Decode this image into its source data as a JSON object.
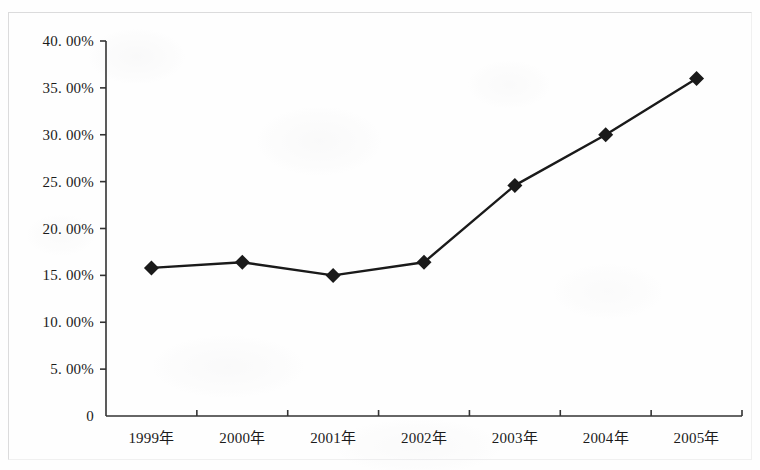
{
  "chart_data": {
    "type": "line",
    "title": "",
    "subtitle": "",
    "xlabel": "",
    "ylabel": "",
    "categories": [
      "1999年",
      "2000年",
      "2001年",
      "2002年",
      "2003年",
      "2004年",
      "2005年"
    ],
    "values": [
      15.8,
      16.4,
      15.0,
      16.4,
      24.6,
      30.0,
      36.0
    ],
    "value_unit": "%",
    "series": [
      {
        "name": "",
        "values": [
          15.8,
          16.4,
          15.0,
          16.4,
          24.6,
          30.0,
          36.0
        ]
      }
    ],
    "ylim": [
      0,
      40
    ],
    "ytick_values": [
      0,
      5,
      10,
      15,
      20,
      25,
      30,
      35,
      40
    ],
    "ytick_labels": [
      "0",
      "5. 00%",
      "10. 00%",
      "15. 00%",
      "20. 00%",
      "25. 00%",
      "30. 00%",
      "35. 00%",
      "40. 00%"
    ],
    "xtick_labels": [
      "1999年",
      "2000年",
      "2001年",
      "2002年",
      "2003年",
      "2004年",
      "2005年"
    ],
    "grid": false,
    "legend": false,
    "legend_position": "none",
    "marker": "diamond",
    "line_color": "#1a1a1a",
    "marker_color": "#1a1a1a",
    "axis_color": "#333333",
    "background_color": "#fefefe",
    "annotations": []
  }
}
